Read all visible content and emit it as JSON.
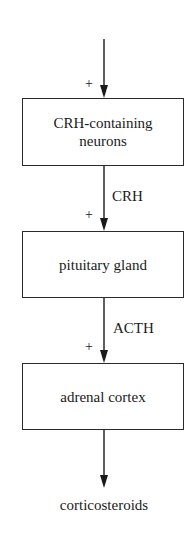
{
  "diagram": {
    "type": "flowchart",
    "direction": "top-to-bottom",
    "nodes": [
      {
        "id": "crh-neurons",
        "label_line1": "CRH-containing",
        "label_line2": "neurons"
      },
      {
        "id": "pituitary",
        "label": "pituitary gland"
      },
      {
        "id": "adrenal",
        "label": "adrenal cortex"
      },
      {
        "id": "output",
        "label": "corticosteroids"
      }
    ],
    "edges": [
      {
        "from": "input",
        "to": "crh-neurons",
        "label": "",
        "sign": "+"
      },
      {
        "from": "crh-neurons",
        "to": "pituitary",
        "label": "CRH",
        "sign": "+"
      },
      {
        "from": "pituitary",
        "to": "adrenal",
        "label": "ACTH",
        "sign": "+"
      },
      {
        "from": "adrenal",
        "to": "output",
        "label": "",
        "sign": ""
      }
    ]
  }
}
